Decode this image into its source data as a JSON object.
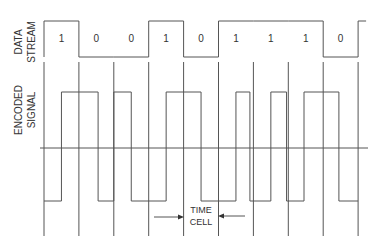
{
  "labels": {
    "data_stream_line1": "DATA",
    "data_stream_line2": "STREAM",
    "encoded_signal_line1": "ENCODED",
    "encoded_signal_line2": "SIGNAL",
    "time_cell_line1": "TIME",
    "time_cell_line2": "CELL"
  },
  "data_stream": {
    "bits": [
      "1",
      "0",
      "0",
      "1",
      "0",
      "1",
      "1",
      "1",
      "0"
    ],
    "levels": [
      1,
      0,
      0,
      1,
      0,
      1,
      1,
      1,
      0
    ],
    "trailing_level": 1
  },
  "encoded_signal": {
    "description": "Square-wave encoded signal with transitions per bit cell",
    "transitions_in_cell_units": [
      0.5,
      1.55,
      2.0,
      2.5,
      3.5,
      4.5,
      5.5,
      5.9,
      6.5,
      6.95,
      7.45,
      8.45
    ],
    "initial_level": -1
  },
  "time_cell": {
    "marked_cell_index": 5
  },
  "colors": {
    "line": "#555555",
    "text": "#333333",
    "background": "#ffffff"
  }
}
